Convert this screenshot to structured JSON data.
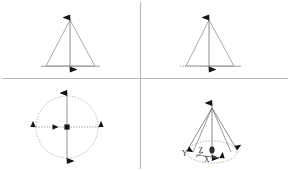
{
  "figure": {
    "layout": "2x2 quadrant grid",
    "divider_color": "#b9b9b9",
    "line_color": "#8a8a8a",
    "arrow_color": "#1a1a1a",
    "background": "#ffffff"
  },
  "panels": [
    {
      "id": "top-left",
      "name": "triangle-vertical-axis",
      "shape": "triangle",
      "axis": "vertical double-headed arrow through apex and base midpoint",
      "baseline": "solid",
      "labels": []
    },
    {
      "id": "top-right",
      "name": "triangle-dotted-base-axis",
      "shape": "triangle",
      "axis": "vertical double-headed arrow through apex and base midpoint",
      "baseline": "dotted extended",
      "labels": []
    },
    {
      "id": "bottom-left",
      "name": "circle-crossed-axes",
      "shape": "circle",
      "axis": "vertical and horizontal double-headed arrows crossing at centre",
      "baseline": "dotted",
      "labels": []
    },
    {
      "id": "bottom-right",
      "name": "cone-xyz-axes",
      "shape": "cone",
      "axis": "three axes meeting at cone apex with elliptical base",
      "baseline": "dotted ellipse",
      "labels": [
        {
          "name": "axis-label-y",
          "text": "Y"
        },
        {
          "name": "axis-label-z",
          "text": "Z"
        },
        {
          "name": "axis-label-x",
          "text": "X"
        }
      ]
    }
  ],
  "labels": {
    "y": "Y",
    "z": "Z",
    "x": "X"
  }
}
